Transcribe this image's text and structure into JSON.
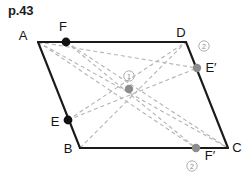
{
  "header": {
    "page_label": "p.43"
  },
  "figure": {
    "type": "parallelogram-diagram",
    "shape_name": "ABCD",
    "colors": {
      "outline": "#1a1a1a",
      "dashed_line": "#b3b3b3",
      "black_point": "#111111",
      "gray_point": "#8c8c8c",
      "step_marker": "#9a9a9a",
      "text": "#141414",
      "background": "#ffffff"
    },
    "vertices": [
      {
        "id": "A",
        "label": "A",
        "x": 38,
        "y": 42,
        "label_x": 23,
        "label_y": 40,
        "marker": "none"
      },
      {
        "id": "D",
        "label": "D",
        "x": 186,
        "y": 42,
        "label_x": 180,
        "label_y": 37,
        "marker": "none"
      },
      {
        "id": "C",
        "label": "C",
        "x": 228,
        "y": 148,
        "label_x": 234,
        "label_y": 152,
        "marker": "none"
      },
      {
        "id": "B",
        "label": "B",
        "x": 80,
        "y": 148,
        "label_x": 66,
        "label_y": 152,
        "marker": "none"
      }
    ],
    "points": [
      {
        "id": "F",
        "label": "F",
        "x": 66,
        "y": 42,
        "label_x": 60,
        "label_y": 31,
        "marker": "black-dot",
        "on_segment": "A-D"
      },
      {
        "id": "E",
        "label": "E",
        "x": 68,
        "y": 120,
        "label_x": 53,
        "label_y": 126,
        "marker": "black-dot",
        "on_segment": "A-B"
      },
      {
        "id": "Eprime",
        "label": "E′",
        "x": 197,
        "y": 68,
        "label_x": 204,
        "label_y": 70,
        "marker": "gray-dot",
        "on_segment": "D-C"
      },
      {
        "id": "Fprime",
        "label": "F′",
        "x": 196,
        "y": 148,
        "label_x": 202,
        "label_y": 158,
        "marker": "gray-dot",
        "on_segment": "B-C"
      },
      {
        "id": "O",
        "label": "",
        "x": 129,
        "y": 89,
        "label_x": 0,
        "label_y": 0,
        "marker": "gray-dot",
        "on_segment": "center"
      }
    ],
    "step_markers": [
      {
        "id": "step-1",
        "label": "①",
        "number": "1",
        "x": 129,
        "y": 76,
        "near": "center"
      },
      {
        "id": "step-2-top",
        "label": "②",
        "number": "2",
        "x": 204,
        "y": 46,
        "near": "Eprime"
      },
      {
        "id": "step-2-bottom",
        "label": "②",
        "number": "2",
        "x": 192,
        "y": 166,
        "near": "Fprime"
      }
    ],
    "solid_edges": [
      {
        "id": "edge-AD",
        "from": "A",
        "to": "D"
      },
      {
        "id": "edge-DC",
        "from": "D",
        "to": "C"
      },
      {
        "id": "edge-BC",
        "from": "B",
        "to": "C"
      },
      {
        "id": "edge-AB",
        "from": "A",
        "to": "B"
      }
    ],
    "dashed_lines": [
      {
        "id": "dash-A-C",
        "from": "A",
        "to": "C"
      },
      {
        "id": "dash-B-D",
        "from": "B",
        "to": "D"
      },
      {
        "id": "dash-F-C",
        "from": "F",
        "to": "C"
      },
      {
        "id": "dash-F-Fprime",
        "from": "F",
        "to": "Fprime"
      },
      {
        "id": "dash-E-D",
        "from": "E",
        "to": "D"
      },
      {
        "id": "dash-E-Eprime",
        "from": "E",
        "to": "Eprime"
      },
      {
        "id": "dash-A-Eprime",
        "from": "A",
        "to": "Eprime"
      },
      {
        "id": "dash-A-Fprime",
        "from": "A",
        "to": "Fprime"
      }
    ]
  }
}
